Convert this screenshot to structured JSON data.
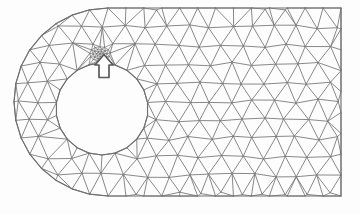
{
  "figure": {
    "name": "triangular-finite-element-mesh",
    "background_color": "#fdfdfd",
    "line_color": "#7a7a7a",
    "boundary_color": "#6f6f6f",
    "arrow_color": "#5a5a5a",
    "arrow_fill": "#ffffff",
    "width": 360,
    "height": 214
  },
  "annotation": {
    "name": "refinement-arrow",
    "kind": "up-arrow-icon",
    "points_to": "refined-element-cluster",
    "x": 104,
    "y": 64
  },
  "geometry": {
    "outer_boundary": {
      "type": "stadium-left-rounded-rectangle",
      "top_y": 8,
      "bottom_y": 196,
      "right_x": 341,
      "arc_center_x": 108,
      "arc_center_y": 102,
      "arc_left_x": 13
    },
    "hole": {
      "type": "circle",
      "center_x": 102,
      "center_y": 109,
      "radius": 46
    },
    "refinement_zone": {
      "center_x": 100,
      "center_y": 54,
      "radius": 18
    }
  },
  "chart_data": {
    "type": "mesh",
    "title": "",
    "element_type": "linear-triangle",
    "node_count": 196,
    "element_count": 330
  }
}
